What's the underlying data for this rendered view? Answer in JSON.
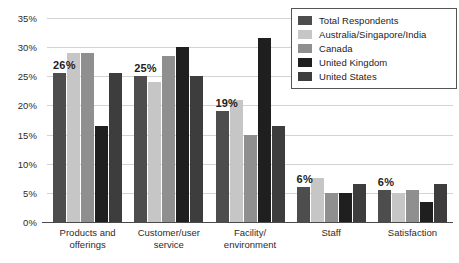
{
  "chart_data": {
    "type": "bar",
    "title": "",
    "subtitle": "",
    "xlabel": "",
    "ylabel": "",
    "ylim": [
      0,
      35
    ],
    "ytick_labels": [
      "35%",
      "30%",
      "25%",
      "20%",
      "15%",
      "10%",
      "5%",
      "0%"
    ],
    "ytick_values": [
      35,
      30,
      25,
      20,
      15,
      10,
      5,
      0
    ],
    "grid": true,
    "legend_position": "top-right",
    "categories": [
      "Products and offerings",
      "Customer/user service",
      "Facility/ environment",
      "Staff",
      "Satisfaction"
    ],
    "category_lines": [
      [
        "Products and",
        "offerings"
      ],
      [
        "Customer/user",
        "service"
      ],
      [
        "Facility/",
        "environment"
      ],
      [
        "Staff",
        ""
      ],
      [
        "Satisfaction",
        ""
      ]
    ],
    "series": [
      {
        "name": "Total Respondents",
        "color": "#4d4d4d",
        "values": [
          25.5,
          25.0,
          19.0,
          6.0,
          5.5
        ]
      },
      {
        "name": "Australia/Singapore/India",
        "color": "#c6c6c6",
        "values": [
          29.0,
          24.0,
          21.0,
          7.5,
          5.0
        ]
      },
      {
        "name": "Canada",
        "color": "#8f8f8f",
        "values": [
          29.0,
          28.5,
          15.0,
          5.0,
          5.5
        ]
      },
      {
        "name": "United Kingdom",
        "color": "#1f1f1f",
        "values": [
          16.5,
          30.0,
          31.5,
          5.0,
          3.5
        ]
      },
      {
        "name": "United States",
        "color": "#3d3d3d",
        "values": [
          25.5,
          25.0,
          16.5,
          6.5,
          6.5
        ]
      }
    ],
    "data_labels": [
      "26%",
      "25%",
      "19%",
      "6%",
      "6%"
    ],
    "gridline_color": "#d3d3d3",
    "axis_color": "#4a4a4a",
    "background_color": "#ffffff"
  }
}
